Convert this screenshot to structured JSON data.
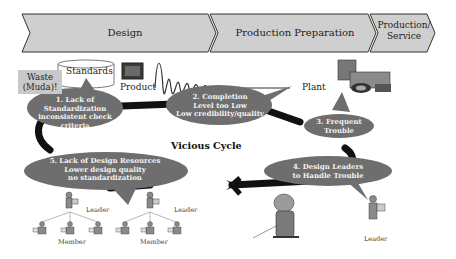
{
  "phases": [
    {
      "label": "Design"
    },
    {
      "label": "Production Preparation"
    },
    {
      "label": "Production/\nService",
      "line1": "Production/",
      "line2": "Service"
    }
  ],
  "labels": {
    "waste_line1": "Waste",
    "waste_line2": "(Muda)!",
    "standards": "Standards",
    "product": "Product",
    "plant": "Plant",
    "vicious_cycle": "Vicious Cycle"
  },
  "bubbles": [
    {
      "id": 1,
      "lines": [
        "1. Lack of",
        "Standardization",
        "inconsistent check criteria"
      ]
    },
    {
      "id": 2,
      "lines": [
        "2. Completion",
        "Level too Low",
        "Low credibility/quality"
      ]
    },
    {
      "id": 3,
      "lines": [
        "3. Frequent",
        "Trouble"
      ]
    },
    {
      "id": 4,
      "lines": [
        "4. Design Leaders",
        "to Handle Trouble"
      ]
    },
    {
      "id": 5,
      "lines": [
        "5. Lack of Design Resources",
        "Lower design quality",
        "no standardization"
      ]
    }
  ],
  "people": {
    "leader_left": "Leader",
    "leader_mid": "Leader",
    "leader_right": "Leader",
    "member_left": "Member",
    "member_mid": "Member"
  },
  "colors": {
    "chevron_fill": "#cfcfcf",
    "bubble_fill": "#6e6e6e",
    "cycle_line": "#111111",
    "waste_fill": "#c9c9c9"
  }
}
